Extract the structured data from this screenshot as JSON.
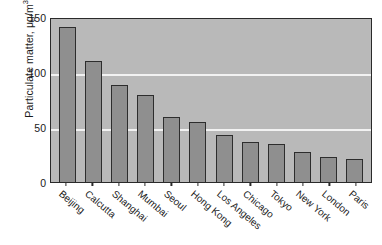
{
  "chart_data": {
    "type": "bar",
    "title": "",
    "xlabel": "",
    "ylabel": "Particulate matter, μg/m",
    "ylabel_sup": "3",
    "categories": [
      "Beijing",
      "Calcutta",
      "Shanghai",
      "Mumbai",
      "Seoul",
      "Hong Kong",
      "Los Angeles",
      "Chicago",
      "Tokyo",
      "New York",
      "London",
      "Paris"
    ],
    "values": [
      141,
      110,
      88,
      79,
      59,
      55,
      43,
      36,
      35,
      27,
      23,
      21
    ],
    "ylim": [
      0,
      150
    ],
    "yticks": [
      0,
      50,
      100,
      150
    ],
    "ytick_labels": [
      "0",
      "50",
      "100",
      "150"
    ],
    "grid": true,
    "gridlines_at": [
      50,
      100
    ],
    "legend": false,
    "colors": {
      "bar_fill": "#8f8f8f",
      "bar_edge": "#2d2d2d",
      "plot_background": "#b9b9b9",
      "gridline": "#f2f2f2",
      "axis": "#2a2a2a",
      "text": "#1a1a1a",
      "figure_background": "#ffffff"
    }
  }
}
